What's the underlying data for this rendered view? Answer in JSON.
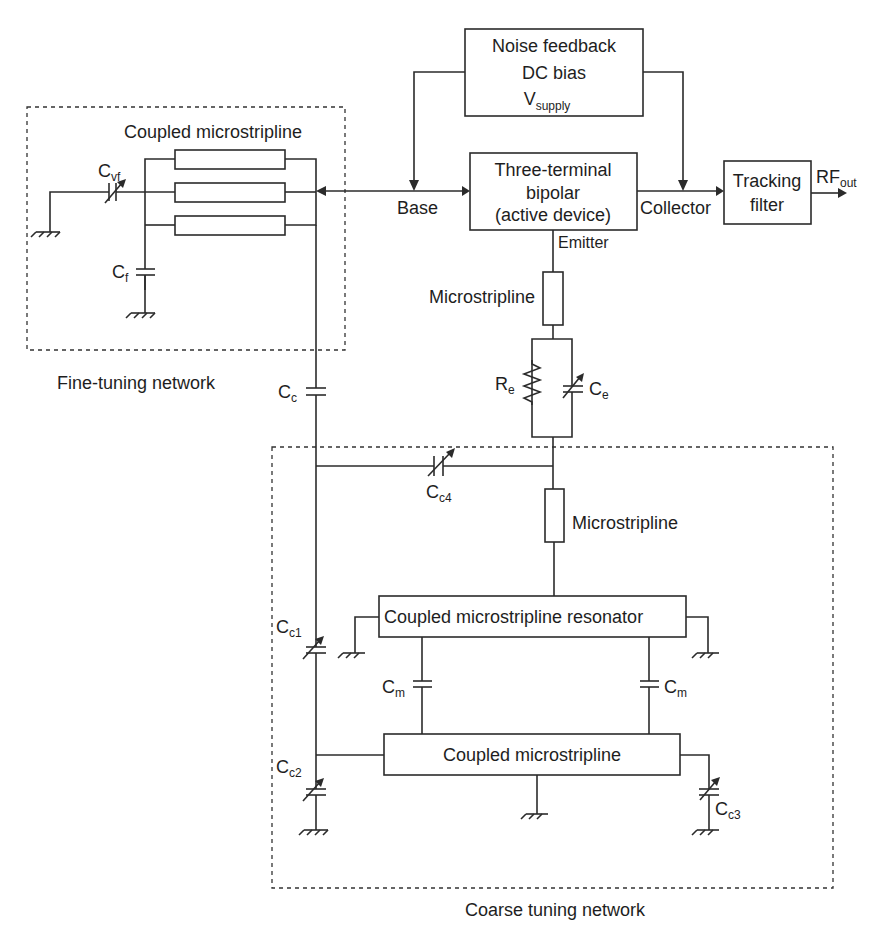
{
  "blocks": {
    "noise_feedback": {
      "line1": "Noise feedback",
      "line2": "DC bias",
      "line3_main": "V",
      "line3_sub": "supply"
    },
    "active_device": {
      "line1": "Three-terminal",
      "line2": "bipolar",
      "line3": "(active device)"
    },
    "tracking_filter": {
      "line1": "Tracking",
      "line2": "filter"
    },
    "fine_coupled_label": "Coupled microstripline",
    "emitter_microstrip": "Microstripline",
    "coarse_microstrip": "Microstripline",
    "resonator": "Coupled microstripline resonator",
    "coarse_coupled": "Coupled microstripline"
  },
  "terminals": {
    "base": "Base",
    "collector": "Collector",
    "emitter": "Emitter",
    "rf_out_main": "RF",
    "rf_out_sub": "out"
  },
  "components": {
    "cvf": {
      "main": "C",
      "sub": "vf"
    },
    "cf": {
      "main": "C",
      "sub": "f"
    },
    "cc": {
      "main": "C",
      "sub": "c"
    },
    "re": {
      "main": "R",
      "sub": "e"
    },
    "ce": {
      "main": "C",
      "sub": "e"
    },
    "cc4": {
      "main": "C",
      "sub": "c4"
    },
    "cc1": {
      "main": "C",
      "sub": "c1"
    },
    "cc2": {
      "main": "C",
      "sub": "c2"
    },
    "cc3": {
      "main": "C",
      "sub": "c3"
    },
    "cm_left": {
      "main": "C",
      "sub": "m"
    },
    "cm_right": {
      "main": "C",
      "sub": "m"
    }
  },
  "networks": {
    "fine": "Fine-tuning network",
    "coarse": "Coarse tuning network"
  }
}
